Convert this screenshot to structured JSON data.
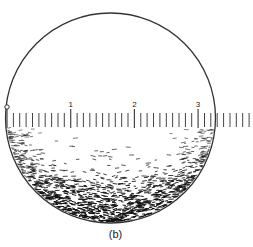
{
  "figure": {
    "caption": "(b)",
    "circle": {
      "cx": 110.5,
      "cy": 118,
      "r": 105,
      "stroke": "#333333"
    },
    "scale": {
      "origin_x": 7,
      "px_per_unit": 63.7,
      "minor_step": 0.1,
      "max_x": 251,
      "major_labels": [
        "1",
        "2",
        "3"
      ],
      "origin_marker": "open-circle",
      "tick_color": "#444444"
    },
    "stipple": {
      "color": "#111111",
      "description": "dense dashed stippling filling lower part of circle, darkest at bottom and edges"
    }
  }
}
